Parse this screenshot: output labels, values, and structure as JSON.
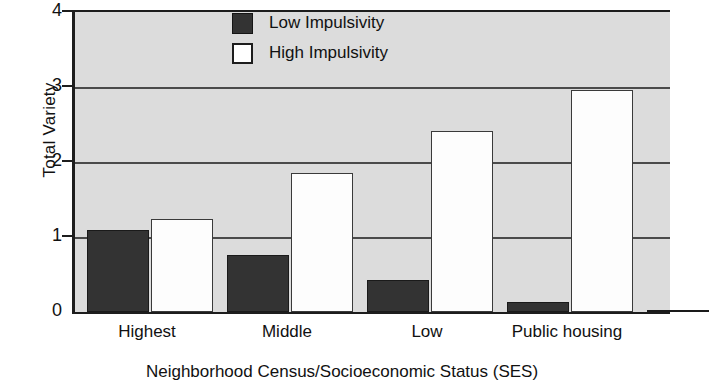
{
  "chart_data": {
    "type": "bar",
    "title": "",
    "xlabel": "Neighborhood Census/Socioeconomic Status (SES)",
    "ylabel": "Total Variety",
    "categories": [
      "Highest",
      "Middle",
      "Low",
      "Public housing"
    ],
    "series": [
      {
        "name": "Low Impulsivity",
        "color": "#333333",
        "values": [
          1.09,
          0.76,
          0.43,
          0.13
        ]
      },
      {
        "name": "High Impulsivity",
        "color": "#ffffff",
        "values": [
          1.24,
          1.85,
          2.41,
          2.96
        ]
      }
    ],
    "ylim": [
      0,
      4
    ],
    "yticks": [
      "0",
      "1",
      "2",
      "3",
      "4"
    ],
    "ytick_values": [
      0,
      1,
      2,
      3,
      4
    ],
    "gridlines": [
      1,
      2,
      3
    ],
    "grid": true,
    "legend_position": "top-center",
    "plot_background": "#dcdcdc",
    "axis_color": "#1d1d1d",
    "note": "right edge of plot is cropped by the screenshot"
  },
  "legend": {
    "items": [
      {
        "label": "Low Impulsivity",
        "swatch": "dark"
      },
      {
        "label": "High Impulsivity",
        "swatch": "light"
      }
    ]
  }
}
